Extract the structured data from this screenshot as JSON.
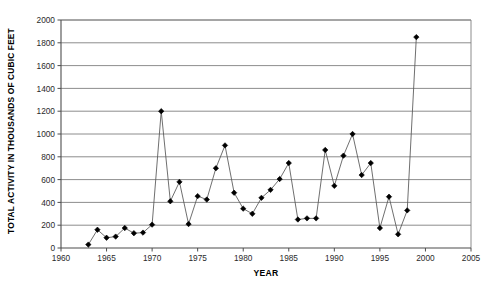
{
  "chart_data": {
    "type": "line",
    "title": "",
    "xlabel": "YEAR",
    "ylabel": "TOTAL ACTIVITY IN THOUSANDS OF CUBIC FEET",
    "xlim": [
      1960,
      2005
    ],
    "ylim": [
      0,
      2000
    ],
    "xticks": [
      1960,
      1965,
      1970,
      1975,
      1980,
      1985,
      1990,
      1995,
      2000,
      2005
    ],
    "yticks": [
      0,
      200,
      400,
      600,
      800,
      1000,
      1200,
      1400,
      1600,
      1800,
      2000
    ],
    "grid": "horizontal",
    "legend": "none",
    "marker": "diamond",
    "line_color": "#555555",
    "marker_color": "#000000",
    "grid_color": "#808080",
    "x": [
      1963,
      1964,
      1965,
      1966,
      1967,
      1968,
      1969,
      1970,
      1971,
      1972,
      1973,
      1974,
      1975,
      1976,
      1977,
      1978,
      1979,
      1980,
      1981,
      1982,
      1983,
      1984,
      1985,
      1986,
      1987,
      1988,
      1989,
      1990,
      1991,
      1992,
      1993,
      1994,
      1995,
      1996,
      1997,
      1998,
      1999
    ],
    "values": [
      30,
      160,
      90,
      100,
      175,
      130,
      135,
      205,
      1200,
      410,
      580,
      210,
      455,
      425,
      700,
      900,
      485,
      345,
      300,
      440,
      510,
      605,
      745,
      250,
      260,
      260,
      860,
      545,
      810,
      1000,
      640,
      745,
      175,
      450,
      120,
      330,
      1850
    ]
  },
  "xtick_labels": [
    "1960",
    "1965",
    "1970",
    "1975",
    "1980",
    "1985",
    "1990",
    "1995",
    "2000",
    "2005"
  ],
  "ytick_labels": [
    "0",
    "200",
    "400",
    "600",
    "800",
    "1000",
    "1200",
    "1400",
    "1600",
    "1800",
    "2000"
  ]
}
